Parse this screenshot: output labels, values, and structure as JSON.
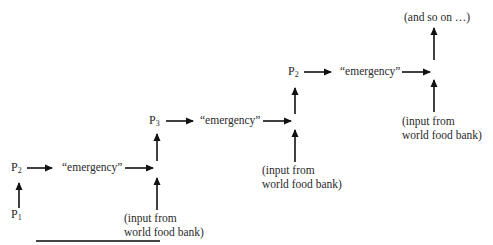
{
  "diagram": {
    "nodes": [
      {
        "id": "p1",
        "base": "P",
        "sub": "1"
      },
      {
        "id": "p2a",
        "base": "P",
        "sub": "2"
      },
      {
        "id": "p3",
        "base": "P",
        "sub": "3"
      },
      {
        "id": "p2b",
        "base": "P",
        "sub": "2"
      }
    ],
    "emergency_labels": [
      "“emergency”",
      "“emergency”",
      "“emergency”"
    ],
    "inputs": [
      {
        "line1": "(input from",
        "line2": "world food bank)"
      },
      {
        "line1": "(input from",
        "line2": "world food bank)"
      },
      {
        "line1": "(input from",
        "line2": "world food bank)"
      }
    ],
    "continuation": "(and so on …)",
    "arrow_color": "#111111"
  }
}
